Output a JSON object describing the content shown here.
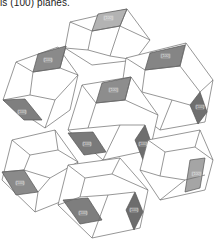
{
  "caption": "ls (100) planes.",
  "figure": {
    "face_label": "(100)",
    "colors": {
      "edge": "#6a6a6a",
      "shade_dark": "#7a7a7a",
      "shade_mid": "#8c8c8c",
      "shade_light": "#a9a9a9",
      "background": "#ffffff"
    },
    "labels": [
      {
        "id": "top",
        "text": "(100)"
      },
      {
        "id": "upper-left",
        "text": "(100)"
      },
      {
        "id": "upper-right",
        "text": "(100)"
      },
      {
        "id": "left-mid",
        "text": "(100)"
      },
      {
        "id": "center-top",
        "text": "(100)"
      },
      {
        "id": "center-left",
        "text": "(100)"
      },
      {
        "id": "center-right",
        "text": "(100)"
      },
      {
        "id": "right-mid",
        "text": "(100)"
      },
      {
        "id": "right-low",
        "text": "(100)"
      },
      {
        "id": "lower-left",
        "text": "(100)"
      },
      {
        "id": "bottom-left",
        "text": "(100)"
      },
      {
        "id": "bottom-right",
        "text": "(100)"
      }
    ]
  }
}
